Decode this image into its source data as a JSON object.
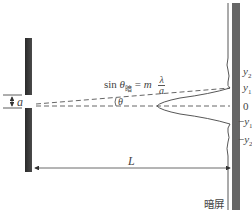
{
  "diagram": {
    "formula": {
      "lhs_func": "sin",
      "lhs_var": "θ",
      "lhs_sub": "暗",
      "equals": "=",
      "coef": "m",
      "frac_num": "λ",
      "frac_den": "a"
    },
    "labels": {
      "slit_width": "a",
      "angle": "θ",
      "distance": "L",
      "screen": "暗屏"
    },
    "screen_positions": [
      {
        "label": "y",
        "sub": "2",
        "sign": ""
      },
      {
        "label": "y",
        "sub": "1",
        "sign": ""
      },
      {
        "label": "0",
        "sub": "",
        "sign": ""
      },
      {
        "label": "y",
        "sub": "1",
        "sign": "−"
      },
      {
        "label": "y",
        "sub": "2",
        "sign": "−"
      }
    ],
    "colors": {
      "slit": "#3a3a3a",
      "screen": "#666666",
      "line": "#555555",
      "text": "#444444"
    }
  }
}
